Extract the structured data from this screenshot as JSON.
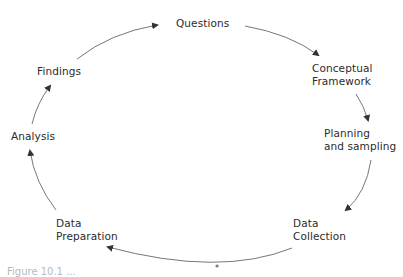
{
  "diagram": {
    "type": "cycle",
    "direction": "clockwise",
    "nodes": [
      {
        "id": "questions",
        "label": "Questions"
      },
      {
        "id": "conceptual-framework",
        "line1": "Conceptual",
        "line2": "Framework"
      },
      {
        "id": "planning-sampling",
        "line1": "Planning",
        "line2": "and sampling"
      },
      {
        "id": "data-collection",
        "line1": "Data",
        "line2": "Collection"
      },
      {
        "id": "data-preparation",
        "line1": "Data",
        "line2": "Preparation"
      },
      {
        "id": "analysis",
        "label": "Analysis"
      },
      {
        "id": "findings",
        "label": "Findings"
      }
    ],
    "edges": [
      [
        "questions",
        "conceptual-framework"
      ],
      [
        "conceptual-framework",
        "planning-sampling"
      ],
      [
        "planning-sampling",
        "data-collection"
      ],
      [
        "data-collection",
        "data-preparation"
      ],
      [
        "data-preparation",
        "analysis"
      ],
      [
        "analysis",
        "findings"
      ],
      [
        "findings",
        "questions"
      ]
    ],
    "colors": {
      "arrow": "#555555",
      "text": "#2b2b2b",
      "background": "#ffffff"
    }
  },
  "caption": {
    "text": "Figure 10.1 ..."
  }
}
